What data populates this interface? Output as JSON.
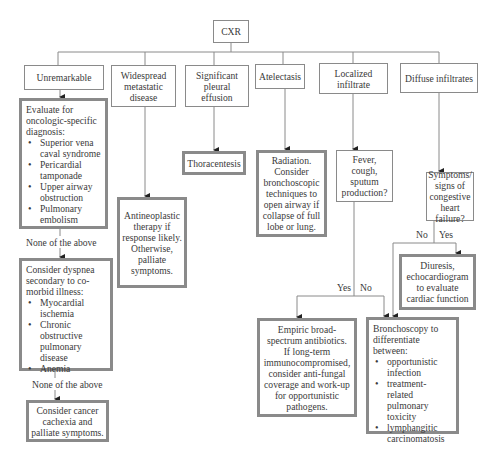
{
  "root": {
    "label": "CXR"
  },
  "level1": [
    {
      "id": "unremarkable",
      "label": "Unremarkable"
    },
    {
      "id": "widespread",
      "label": "Widespread\nmetastatic\ndisease"
    },
    {
      "id": "pleural",
      "label": "Significant\npleural\neffusion"
    },
    {
      "id": "atelectasis",
      "label": "Atelectasis"
    },
    {
      "id": "localized",
      "label": "Localized\ninfiltrate"
    },
    {
      "id": "diffuse",
      "label": "Diffuse infiltrates"
    }
  ],
  "evaluate": {
    "heading": "Evaluate for oncologic-specific diagnosis:",
    "items": [
      "Superior vena caval syndrome",
      "Pericardial tamponade",
      "Upper airway obstruction",
      "Pulmonary embolism"
    ]
  },
  "none_above_1": "None of the above",
  "comorbid": {
    "heading": "Consider dyspnea secondary to co-morbid illness:",
    "items": [
      "Myocardial ischemia",
      "Chronic obstructive pulmonary disease",
      "Anemia"
    ]
  },
  "none_above_2": "None of the above",
  "cachexia": "Consider cancer\ncachexia and\npalliate symptoms.",
  "antineoplastic": "Antineoplastic\ntherapy if\nresponse likely.\nOtherwise,\npalliate\nsymptoms.",
  "thoracentesis": "Thoracentesis",
  "radiation": "Radiation.\nConsider\nbronchoscopic\ntechniques to\nopen airway if\ncollapse of full\nlobe or lung.",
  "fever": "Fever,\ncough,\nsputum\nproduction?",
  "fever_yes": "Yes",
  "fever_no": "No",
  "chf": "Symptoms/\nsigns of\ncongestive\nheart failure?",
  "chf_no": "No",
  "chf_yes": "Yes",
  "diuresis": "Diuresis,\nechocardiogram\nto evaluate\ncardiac function",
  "empiric": "Empiric broad-\nspectrum antibiotics.\nIf long-term\nimmunocompromised,\nconsider anti-fungal\ncoverage and work-up\nfor opportunistic\npathogens.",
  "bronchoscopy": {
    "heading": "Bronchoscopy to differentiate between:",
    "items": [
      "opportunistic infection",
      "treatment-related pulmonary toxicity",
      "lymphangitic carcinomatosis"
    ]
  },
  "colors": {
    "border": "#8a8a8a",
    "line": "#8a8a8a",
    "text": "#3a3a3a",
    "arrow": "#222222"
  }
}
